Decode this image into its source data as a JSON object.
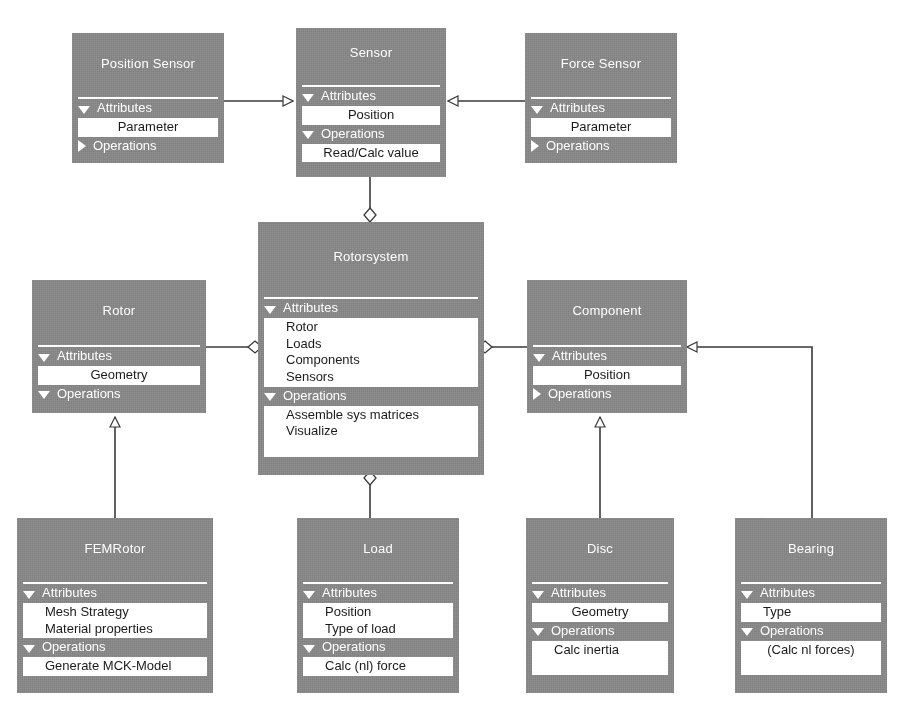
{
  "diagram": {
    "kind": "uml-class-diagram",
    "colors": {
      "class_fill": "#888888",
      "class_title_text": "#ffffff",
      "member_fill": "#ffffff",
      "member_text": "#1b1b1b",
      "line": "#3a3a3a",
      "background": "#ffffff"
    },
    "section_labels": {
      "attributes": "Attributes",
      "operations": "Operations"
    },
    "classes": [
      {
        "id": "position-sensor",
        "name": "Position Sensor",
        "attributes_expanded": true,
        "operations_expanded": false,
        "attributes": [
          "Parameter"
        ],
        "operations": []
      },
      {
        "id": "sensor",
        "name": "Sensor",
        "attributes_expanded": true,
        "operations_expanded": true,
        "attributes": [
          "Position"
        ],
        "operations": [
          "Read/Calc value"
        ]
      },
      {
        "id": "force-sensor",
        "name": "Force Sensor",
        "attributes_expanded": true,
        "operations_expanded": false,
        "attributes": [
          "Parameter"
        ],
        "operations": []
      },
      {
        "id": "rotorsystem",
        "name": "Rotorsystem",
        "attributes_expanded": true,
        "operations_expanded": true,
        "attributes": [
          "Rotor",
          "Loads",
          "Components",
          "Sensors"
        ],
        "operations": [
          "Assemble sys matrices",
          "Visualize"
        ]
      },
      {
        "id": "rotor",
        "name": "Rotor",
        "attributes_expanded": true,
        "operations_expanded": true,
        "attributes": [
          "Geometry"
        ],
        "operations": []
      },
      {
        "id": "component",
        "name": "Component",
        "attributes_expanded": true,
        "operations_expanded": false,
        "attributes": [
          "Position"
        ],
        "operations": []
      },
      {
        "id": "femrotor",
        "name": "FEMRotor",
        "attributes_expanded": true,
        "operations_expanded": true,
        "attributes": [
          "Mesh Strategy",
          "Material properties"
        ],
        "operations": [
          "Generate MCK-Model"
        ]
      },
      {
        "id": "load",
        "name": "Load",
        "attributes_expanded": true,
        "operations_expanded": true,
        "attributes": [
          "Position",
          "Type of load"
        ],
        "operations": [
          "Calc (nl) force"
        ]
      },
      {
        "id": "disc",
        "name": "Disc",
        "attributes_expanded": true,
        "operations_expanded": true,
        "attributes": [
          "Geometry"
        ],
        "operations": [
          "Calc inertia"
        ]
      },
      {
        "id": "bearing",
        "name": "Bearing",
        "attributes_expanded": true,
        "operations_expanded": true,
        "attributes": [
          "Type"
        ],
        "operations": [
          "(Calc nl forces)"
        ]
      }
    ],
    "relations": [
      {
        "id": "position-sensor-to-sensor",
        "type": "generalization",
        "from": "position-sensor",
        "to": "sensor"
      },
      {
        "id": "force-sensor-to-sensor",
        "type": "generalization",
        "from": "force-sensor",
        "to": "sensor"
      },
      {
        "id": "rotorsystem-to-sensor",
        "type": "aggregation",
        "from": "rotorsystem",
        "to": "sensor"
      },
      {
        "id": "rotorsystem-to-rotor",
        "type": "aggregation",
        "from": "rotorsystem",
        "to": "rotor"
      },
      {
        "id": "rotorsystem-to-component",
        "type": "aggregation",
        "from": "rotorsystem",
        "to": "component"
      },
      {
        "id": "rotorsystem-to-load",
        "type": "aggregation",
        "from": "rotorsystem",
        "to": "load"
      },
      {
        "id": "femrotor-to-rotor",
        "type": "generalization",
        "from": "femrotor",
        "to": "rotor"
      },
      {
        "id": "disc-to-component",
        "type": "generalization",
        "from": "disc",
        "to": "component"
      },
      {
        "id": "bearing-to-component",
        "type": "generalization",
        "from": "bearing",
        "to": "component"
      }
    ]
  }
}
